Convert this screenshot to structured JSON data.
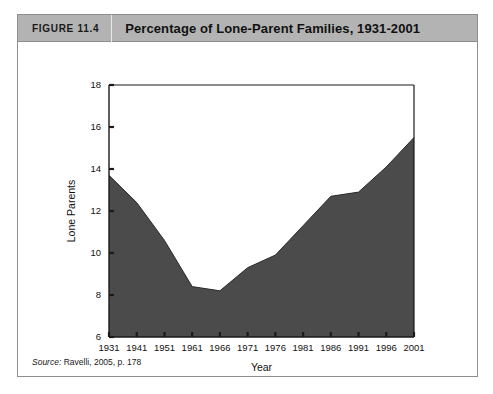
{
  "figure": {
    "number_label": "FIGURE 11.4",
    "title": "Percentage of Lone-Parent Families, 1931-2001",
    "source_label": "Source:",
    "source_text": "Ravelli, 2005, p. 178"
  },
  "colors": {
    "header_bar": "#b3b3b3",
    "area_fill": "#4b4b4b",
    "axis": "#1a1a1a",
    "box_border": "#8e8e8e"
  },
  "chart_data": {
    "type": "area",
    "title": "Percentage of Lone-Parent Families, 1931-2001",
    "xlabel": "Year",
    "ylabel": "Lone Parents",
    "categories": [
      "1931",
      "1941",
      "1951",
      "1961",
      "1966",
      "1971",
      "1976",
      "1981",
      "1986",
      "1991",
      "1996",
      "2001"
    ],
    "values": [
      13.7,
      12.4,
      10.6,
      8.4,
      8.2,
      9.3,
      9.9,
      11.3,
      12.7,
      12.9,
      14.1,
      15.5
    ],
    "ylim": [
      6,
      18
    ],
    "yticks": [
      6,
      8,
      10,
      12,
      14,
      16,
      18
    ],
    "ytick_labels": [
      "6",
      "8",
      "10",
      "12",
      "14",
      "16",
      "18"
    ],
    "grid": false,
    "legend": "none"
  }
}
